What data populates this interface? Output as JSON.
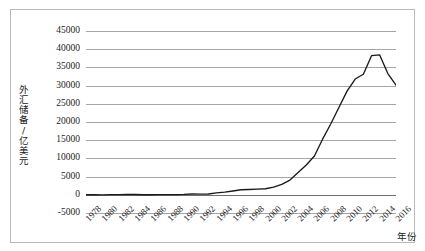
{
  "chart_data": {
    "type": "line",
    "title": "",
    "subtitle": "",
    "xlabel": "年份",
    "ylabel": "外汇储备/亿美元",
    "ylim": [
      -5000,
      45000
    ],
    "xlim": [
      1978,
      2016
    ],
    "grid": true,
    "legend": false,
    "legend_position": "none",
    "yticks": [
      45000,
      40000,
      35000,
      30000,
      25000,
      20000,
      15000,
      10000,
      5000,
      0,
      -5000
    ],
    "ytick_labels": [
      "45000",
      "40000",
      "35000",
      "30000",
      "25000",
      "20000",
      "15000",
      "10000",
      "5000",
      "0",
      "-5000"
    ],
    "xticks": [
      1978,
      1980,
      1982,
      1984,
      1986,
      1988,
      1990,
      1992,
      1994,
      1996,
      1998,
      2000,
      2002,
      2004,
      2006,
      2008,
      2010,
      2012,
      2014,
      2016
    ],
    "xtick_labels": [
      "1978",
      "1980",
      "1982",
      "1984",
      "1986",
      "1988",
      "1990",
      "1992",
      "1994",
      "1996",
      "1998",
      "2000",
      "2002",
      "2004",
      "2006",
      "2008",
      "2010",
      "2012",
      "2014",
      "2016"
    ],
    "series": [
      {
        "name": "外汇储备",
        "color": "#1a1a1a",
        "x": [
          1978,
          1979,
          1980,
          1981,
          1982,
          1983,
          1984,
          1985,
          1986,
          1987,
          1988,
          1989,
          1990,
          1991,
          1992,
          1993,
          1994,
          1995,
          1996,
          1997,
          1998,
          1999,
          2000,
          2001,
          2002,
          2003,
          2004,
          2005,
          2006,
          2007,
          2008,
          2009,
          2010,
          2011,
          2012,
          2013,
          2014,
          2015,
          2016
        ],
        "values": [
          2,
          8,
          -13,
          27,
          70,
          89,
          82,
          26,
          21,
          29,
          34,
          56,
          111,
          217,
          194,
          212,
          516,
          736,
          1050,
          1399,
          1450,
          1547,
          1656,
          2122,
          2864,
          4033,
          6099,
          8189,
          10663,
          15282,
          19460,
          23992,
          28473,
          31811,
          33116,
          38213,
          38430,
          33304,
          30105
        ]
      }
    ]
  }
}
